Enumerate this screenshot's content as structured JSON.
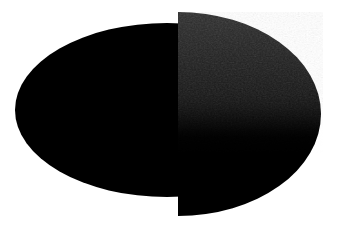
{
  "canvas": {
    "width": 338,
    "height": 230,
    "background_color": "#ffffff",
    "description": "Two overlapping filled dark ellipse shapes on a plain white background"
  },
  "shapes": {
    "left_ellipse": {
      "label": "left-ellipse",
      "fill_color": "#000000",
      "center_x": 167,
      "center_y": 110,
      "radius_x": 152,
      "radius_y": 87,
      "left_edge": 15,
      "right_edge": 319,
      "top_edge": 23,
      "bottom_edge": 197,
      "opacity": 1
    },
    "right_half_ellipse": {
      "label": "right-half-ellipse",
      "clip_edge_x": 178,
      "center_x": 178,
      "center_y": 114,
      "radius_x": 143,
      "radius_y": 102,
      "top_edge": 12,
      "bottom_edge": 216,
      "right_edge": 321,
      "gradient_top_color": "#2f2f2f",
      "gradient_mid_color": "#151515",
      "gradient_bottom_color": "#000000",
      "gradient_top_stop_pct": 0,
      "gradient_mid_stop_pct": 45,
      "gradient_bottom_stop_pct": 62,
      "texture": "mottled-noise",
      "texture_opacity": 0.32,
      "texture_extent_pct": 55
    }
  },
  "palette": {
    "background": "#ffffff",
    "black": "#000000",
    "dark_gray": "#2f2f2f",
    "mid_gray": "#151515"
  }
}
